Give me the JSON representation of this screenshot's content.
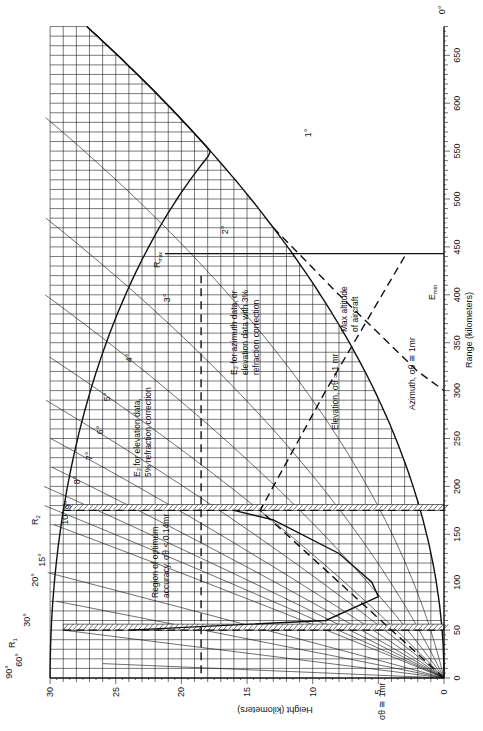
{
  "chart_data": {
    "type": "line",
    "xlabel": "Range (kilometers)",
    "ylabel": "Height (kilometers)",
    "orientation": "rotated 90° — range axis vertical on right, height axis horizontal along bottom",
    "range_ticks": [
      0,
      50,
      100,
      150,
      200,
      250,
      300,
      350,
      400,
      450,
      500,
      550,
      600,
      650
    ],
    "height_ticks": [
      0,
      5,
      10,
      15,
      20,
      25,
      30
    ],
    "xlim": [
      0,
      680
    ],
    "ylim": [
      0,
      30
    ],
    "grid": true,
    "elevation_angle_labels": [
      "90°",
      "60°",
      "30°",
      "20°",
      "15°",
      "10°",
      "9°",
      "8°",
      "7°",
      "6°",
      "5°",
      "4°",
      "3°",
      "2°",
      "1°",
      "0°"
    ],
    "markers": [
      {
        "name": "R1",
        "range_km": 50
      },
      {
        "name": "R2",
        "range_km": 175
      },
      {
        "name": "Rmax",
        "range_km": 443
      }
    ],
    "annotations": [
      "Region of optimum accuracy, σθ < 0.14mr",
      "E2 for elevation data, 5% refraction correction",
      "E2 for azimuth data, or elevation data with 3% refraction correction",
      "Max altitude of aircraft",
      "Elevation, σθ = 1 mr",
      "Azimuth, σθ ≅ 1mr",
      "Emin",
      "σθ ≅ 1mr"
    ],
    "series": [
      {
        "name": "Max altitude of aircraft",
        "style": "dashed",
        "height_km": 18.5,
        "range_km": [
          5,
          420
        ]
      },
      {
        "name": "Elevation σθ = 1 mr",
        "style": "dashed",
        "points_range_height": [
          [
            0,
            0
          ],
          [
            175,
            14
          ],
          [
            300,
            9
          ],
          [
            440,
            3
          ]
        ]
      },
      {
        "name": "Azimuth σθ ≅ 1mr (Emin)",
        "style": "dashed",
        "points_range_height": [
          [
            470,
            13
          ],
          [
            400,
            8
          ],
          [
            320,
            2
          ],
          [
            300,
            0
          ]
        ]
      }
    ]
  },
  "labels": {
    "range_axis_title": "Range (kilometers)",
    "height_axis_title": "Height (kilometers)",
    "r1": "R",
    "r1_sub": "1",
    "r2": "R",
    "r2_sub": "2",
    "rmax": "R",
    "rmax_sub": "max",
    "emin": "E",
    "emin_sub": "min",
    "region_line1": "Region of optimum",
    "region_line2": "accuracy, σθ < 0.14mr",
    "e2_elev_line1": "E₂ for elevation data,",
    "e2_elev_line2": "5% refraction correction",
    "e2_az_line1": "E₂ for azimuth data, or",
    "e2_az_line2": "elevation data with 3%",
    "e2_az_line3": "refraction correction",
    "max_alt_line1": "Max altitude",
    "max_alt_line2": "of aircraft",
    "elevation_label": "Elevation, σθ = 1 mr",
    "azimuth_label": "Azimuth, σθ ≅ 1mr",
    "sigma_label": "σθ ≅ 1mr",
    "sigma_5": "5"
  }
}
